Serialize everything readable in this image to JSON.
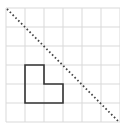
{
  "diagram": {
    "type": "grid-reflection",
    "grid": {
      "columns": 6,
      "rows": 6,
      "origin_x": 6,
      "origin_y": 8,
      "cell_size": 19,
      "line_color": "#d9d9d9"
    },
    "shape": {
      "name": "L-shape",
      "cells": [
        [
          1,
          3
        ],
        [
          1,
          4
        ],
        [
          2,
          4
        ]
      ],
      "vertices_grid": [
        [
          1,
          3
        ],
        [
          2,
          3
        ],
        [
          2,
          4
        ],
        [
          3,
          4
        ],
        [
          3,
          5
        ],
        [
          1,
          5
        ]
      ],
      "stroke_color": "#333333"
    },
    "mirror_line": {
      "style": "dotted",
      "from_grid": [
        0,
        0
      ],
      "to_grid": [
        6,
        6
      ],
      "color": "#444444"
    }
  }
}
